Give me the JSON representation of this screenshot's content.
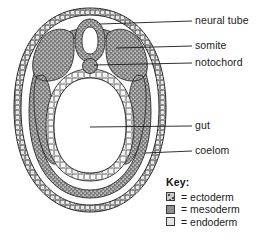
{
  "figure": {
    "type": "biological-cross-section",
    "labels": [
      {
        "id": "neural-tube",
        "text": "neural tube",
        "x": 196,
        "y": 18,
        "leader": {
          "x1": 100,
          "y1": 24,
          "x2": 192,
          "y2": 22
        }
      },
      {
        "id": "somite",
        "text": "somite",
        "x": 196,
        "y": 43,
        "leader": {
          "x1": 116,
          "y1": 48,
          "x2": 192,
          "y2": 47
        }
      },
      {
        "id": "notochord",
        "text": "notochord",
        "x": 196,
        "y": 60,
        "leader": {
          "x1": 94,
          "y1": 64,
          "x2": 192,
          "y2": 64
        }
      },
      {
        "id": "gut",
        "text": "gut",
        "x": 196,
        "y": 122,
        "leader": {
          "x1": 90,
          "y1": 127,
          "x2": 192,
          "y2": 127
        }
      },
      {
        "id": "coelom",
        "text": "coelom",
        "x": 196,
        "y": 147,
        "leader": {
          "x1": 145,
          "y1": 153,
          "x2": 192,
          "y2": 152
        }
      }
    ]
  },
  "key": {
    "title": "Key:",
    "entries": [
      {
        "id": "ectoderm",
        "swatch": "ectoderm-swatch",
        "text": "= ectoderm",
        "color": "#c9c9c9"
      },
      {
        "id": "mesoderm",
        "swatch": "mesoderm-swatch",
        "text": "= mesoderm",
        "color": "#8e8e8e"
      },
      {
        "id": "endoderm",
        "swatch": "endoderm-swatch",
        "text": "= endoderm",
        "color": "#e3e3e3"
      }
    ]
  },
  "colors": {
    "ectoderm": "#c9c9c9",
    "mesoderm": "#8e8e8e",
    "endoderm": "#e3e3e3",
    "outline": "#2b2b2b",
    "background": "#ffffff",
    "text": "#1a1a1a"
  }
}
